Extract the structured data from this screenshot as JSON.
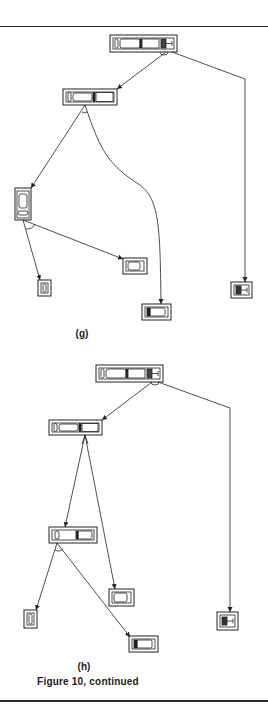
{
  "figure": {
    "caption": "Figure 10, continued",
    "panels": [
      {
        "id": "g",
        "label": "(g)",
        "nodes": [
          {
            "name": "root",
            "x": 110,
            "y": 35,
            "w": 67,
            "h": 17,
            "orientation": "horizontal",
            "parts": 4
          },
          {
            "name": "node-a",
            "x": 63,
            "y": 89,
            "w": 54,
            "h": 16,
            "orientation": "horizontal",
            "parts": 3
          },
          {
            "name": "node-b",
            "x": 15,
            "y": 188,
            "w": 16,
            "h": 32,
            "orientation": "vertical",
            "parts": 2
          },
          {
            "name": "leaf-1",
            "x": 123,
            "y": 258,
            "w": 24,
            "h": 16,
            "orientation": "horizontal",
            "parts": 1
          },
          {
            "name": "leaf-2",
            "x": 38,
            "y": 280,
            "w": 13,
            "h": 16,
            "orientation": "horizontal",
            "parts": 1
          },
          {
            "name": "leaf-3",
            "x": 142,
            "y": 304,
            "w": 29,
            "h": 16,
            "orientation": "horizontal",
            "parts": 2
          },
          {
            "name": "leaf-4",
            "x": 231,
            "y": 282,
            "w": 21,
            "h": 16,
            "orientation": "horizontal",
            "parts": 2
          }
        ]
      },
      {
        "id": "h",
        "label": "(h)",
        "nodes": [
          {
            "name": "root",
            "x": 96,
            "y": 365,
            "w": 67,
            "h": 17,
            "orientation": "horizontal",
            "parts": 4
          },
          {
            "name": "node-a",
            "x": 49,
            "y": 420,
            "w": 53,
            "h": 15,
            "orientation": "horizontal",
            "parts": 3
          },
          {
            "name": "node-b",
            "x": 49,
            "y": 527,
            "w": 48,
            "h": 16,
            "orientation": "horizontal",
            "parts": 2
          },
          {
            "name": "leaf-1",
            "x": 109,
            "y": 589,
            "w": 25,
            "h": 17,
            "orientation": "horizontal",
            "parts": 1
          },
          {
            "name": "leaf-2",
            "x": 24,
            "y": 610,
            "w": 13,
            "h": 18,
            "orientation": "horizontal",
            "parts": 1
          },
          {
            "name": "leaf-3",
            "x": 129,
            "y": 636,
            "w": 29,
            "h": 16,
            "orientation": "horizontal",
            "parts": 2
          },
          {
            "name": "leaf-4",
            "x": 217,
            "y": 612,
            "w": 21,
            "h": 18,
            "orientation": "horizontal",
            "parts": 2
          }
        ]
      }
    ]
  }
}
